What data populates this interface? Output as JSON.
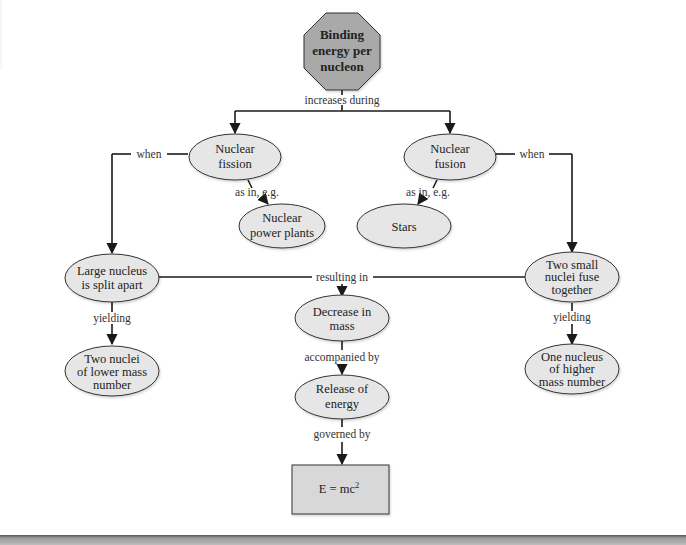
{
  "diagram": {
    "type": "concept-map",
    "colors": {
      "root_fill": "#a9a9a9",
      "ellipse_fill": "#e6e6e6",
      "box_fill": "#d8d8d8",
      "line": "#1a1a1a",
      "text": "#222222"
    },
    "nodes": {
      "root": {
        "lines": [
          "Binding",
          "energy per",
          "nucleon"
        ],
        "shape": "octagon"
      },
      "fission": {
        "lines": [
          "Nuclear",
          "fission"
        ],
        "shape": "ellipse"
      },
      "fusion": {
        "lines": [
          "Nuclear",
          "fusion"
        ],
        "shape": "ellipse"
      },
      "power_plants": {
        "lines": [
          "Nuclear",
          "power plants"
        ],
        "shape": "ellipse"
      },
      "stars": {
        "lines": [
          "Stars"
        ],
        "shape": "ellipse"
      },
      "large_nucleus": {
        "lines": [
          "Large nucleus",
          "is split apart"
        ],
        "shape": "ellipse"
      },
      "small_nuclei": {
        "lines": [
          "Two small",
          "nuclei fuse",
          "together"
        ],
        "shape": "ellipse"
      },
      "decrease_mass": {
        "lines": [
          "Decrease in",
          "mass"
        ],
        "shape": "ellipse"
      },
      "release_energy": {
        "lines": [
          "Release of",
          "energy"
        ],
        "shape": "ellipse"
      },
      "lower_mass": {
        "lines": [
          "Two nuclei",
          "of lower mass",
          "number"
        ],
        "shape": "ellipse"
      },
      "higher_mass": {
        "lines": [
          "One nucleus",
          "of higher",
          "mass number"
        ],
        "shape": "ellipse"
      },
      "emc2": {
        "base": "E = mc",
        "superscript": "2",
        "shape": "rectangle"
      }
    },
    "edges": {
      "increases_during": "increases during",
      "when_left": "when",
      "when_right": "when",
      "as_in_fission": "as in, e.g.",
      "as_in_fusion": "as in, e.g.",
      "resulting_in": "resulting in",
      "yielding_left": "yielding",
      "yielding_right": "yielding",
      "accompanied_by": "accompanied by",
      "governed_by": "governed by"
    }
  }
}
